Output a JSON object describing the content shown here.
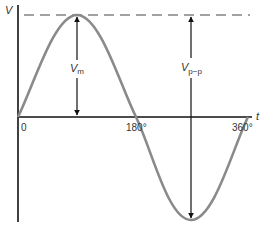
{
  "diagram": {
    "y_axis_label": "V",
    "x_axis_label": "t",
    "x_ticks": [
      "0",
      "180°",
      "360°"
    ],
    "peak_label": {
      "main": "V",
      "sub": "m"
    },
    "peak_to_peak_label": {
      "main": "V",
      "sub": "p−p"
    },
    "colors": {
      "axis": "#111111",
      "wave": "#8a8a8a",
      "arrow": "#111111",
      "dashed": "#444444",
      "text": "#333333"
    }
  }
}
